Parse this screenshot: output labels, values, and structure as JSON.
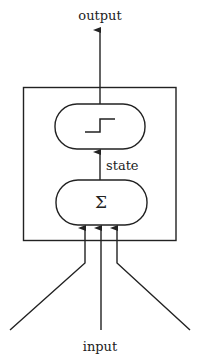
{
  "diagram": {
    "type": "neuron-model",
    "labels": {
      "output": "output",
      "input": "input",
      "state": "state"
    },
    "nodes": [
      {
        "id": "threshold",
        "symbol": "step-function",
        "shape": "rounded-rect"
      },
      {
        "id": "sum",
        "symbol": "Σ",
        "shape": "rounded-rect"
      }
    ],
    "container": {
      "shape": "rectangle"
    },
    "edges": [
      {
        "from": "input-1",
        "to": "sum"
      },
      {
        "from": "input-2",
        "to": "sum"
      },
      {
        "from": "input-3",
        "to": "sum"
      },
      {
        "from": "sum",
        "to": "threshold",
        "label": "state"
      },
      {
        "from": "threshold",
        "to": "output"
      }
    ],
    "colors": {
      "stroke": "#222222",
      "background": "#ffffff"
    }
  }
}
